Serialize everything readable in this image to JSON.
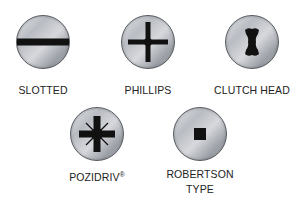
{
  "diagram": {
    "items": [
      {
        "id": "slotted",
        "label": "SLOTTED",
        "icon": "slotted-drive-icon"
      },
      {
        "id": "phillips",
        "label": "PHILLIPS",
        "icon": "phillips-drive-icon"
      },
      {
        "id": "clutch",
        "label": "CLUTCH HEAD",
        "icon": "clutch-head-drive-icon"
      },
      {
        "id": "pozidriv",
        "label": "POZIDRIV",
        "label_mark": "®",
        "icon": "pozidriv-drive-icon"
      },
      {
        "id": "robertson",
        "label_line1": "ROBERTSON",
        "label_line2": "TYPE",
        "icon": "robertson-drive-icon"
      }
    ],
    "colors": {
      "background": "#ffffff",
      "recess": "#111111",
      "head_light": "#e4e6ea",
      "head_dark": "#9a9ea5",
      "outline": "#555a60",
      "text": "#222222"
    }
  }
}
